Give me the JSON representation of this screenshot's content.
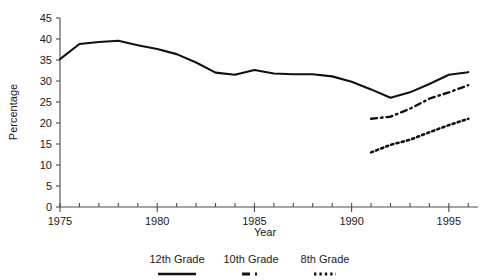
{
  "chart_data": {
    "type": "line",
    "title": "",
    "xlabel": "Year",
    "ylabel": "Percentage",
    "xlim": [
      1975,
      1996.5
    ],
    "ylim": [
      0,
      45
    ],
    "ytick_step": 5,
    "yticks": [
      0,
      5,
      10,
      15,
      20,
      25,
      30,
      35,
      40,
      45
    ],
    "ytick_labels": [
      "0",
      "5",
      "10",
      "15",
      "20",
      "25",
      "30",
      "35",
      "40",
      "45"
    ],
    "xticks_major": [
      1975,
      1980,
      1985,
      1990,
      1995
    ],
    "xtick_labels": [
      "1975",
      "1980",
      "1985",
      "1990",
      "1995"
    ],
    "xtick_minor_every": 1,
    "grid": false,
    "legend_position": "bottom-center",
    "series": [
      {
        "name": "12th Grade",
        "style": "solid",
        "x": [
          1975,
          1976,
          1977,
          1978,
          1979,
          1980,
          1981,
          1982,
          1983,
          1984,
          1985,
          1986,
          1987,
          1988,
          1989,
          1990,
          1991,
          1992,
          1993,
          1994,
          1995,
          1996
        ],
        "values": [
          35.2,
          38.8,
          39.3,
          39.6,
          38.5,
          37.6,
          36.4,
          34.4,
          32.0,
          31.5,
          32.6,
          31.8,
          31.6,
          31.6,
          31.1,
          29.8,
          28.0,
          26.0,
          27.3,
          29.3,
          31.5,
          32.1
        ]
      },
      {
        "name": "10th Grade",
        "style": "dash-dot",
        "x": [
          1991,
          1992,
          1993,
          1994,
          1995,
          1996
        ],
        "values": [
          21.0,
          21.5,
          23.4,
          25.8,
          27.3,
          29.0
        ]
      },
      {
        "name": "8th Grade",
        "style": "dotted",
        "x": [
          1991,
          1992,
          1993,
          1994,
          1995,
          1996
        ],
        "values": [
          13.0,
          14.8,
          16.0,
          17.8,
          19.5,
          21.0
        ]
      }
    ]
  },
  "axes": {
    "y_title": "Percentage",
    "x_title": "Year"
  },
  "legend": {
    "items": [
      {
        "label": "12th Grade",
        "marker": "solid-line-swatch"
      },
      {
        "label": "10th Grade",
        "marker": "dash-dot-line-swatch"
      },
      {
        "label": "8th Grade",
        "marker": "dotted-line-swatch"
      }
    ]
  }
}
